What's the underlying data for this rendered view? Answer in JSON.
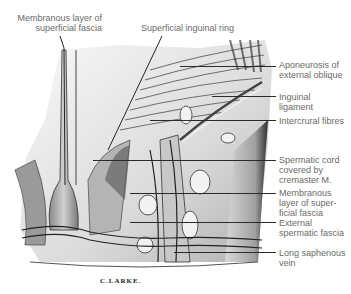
{
  "figure": {
    "signature": "C.LARKE.",
    "labels": {
      "membranous_layer_top": "Membranous layer of\nsuperficial fascia",
      "superficial_inguinal_ring": "Superficial inguinal ring",
      "aponeurosis": "Aponeurosis of\nexternal oblique",
      "inguinal_ligament": "Inguinal\nligament",
      "intercrural_fibres": "Intercrural fibres",
      "spermatic_cord": "Spermatic cord\ncovered by\ncremaster M.",
      "membranous_layer_right": "Membranous\nlayer of super-\nficial fascia",
      "external_spermatic_fascia": "External\nspermatic fascia",
      "long_saphenous_vein": "Long saphenous\nvein"
    },
    "colors": {
      "label_text": "#6a6a6a",
      "leader_line": "#2a2a2a",
      "background": "#ffffff"
    }
  }
}
